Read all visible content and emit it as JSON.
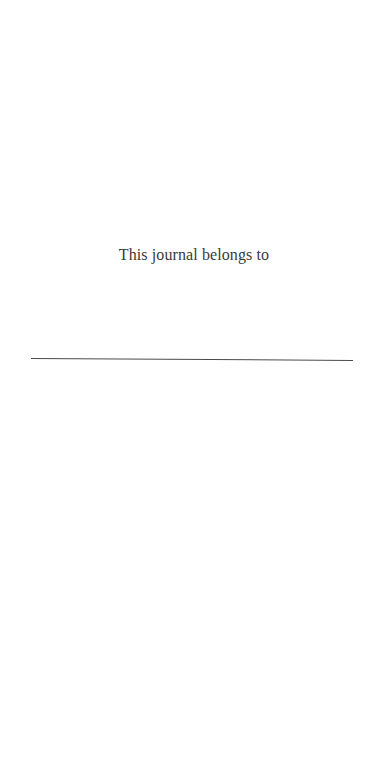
{
  "page": {
    "owner_label": "This journal belongs to",
    "owner_line_color": "#4a4a4a",
    "text_color": "#3a3a3a",
    "background": "#ffffff"
  }
}
